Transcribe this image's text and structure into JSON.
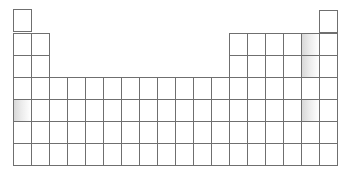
{
  "diagram": {
    "title": "",
    "type": "periodic-table-grid",
    "colors": {
      "line": "#6f6f6f",
      "background": "#ffffff",
      "shade_start": "#d8d8d8",
      "shade_end": "#ffffff"
    },
    "layout": {
      "origin_x": 13,
      "cell_w": 18,
      "cell_h": 22,
      "row1_top": 9,
      "row1_top_right": 10,
      "row_tops": [
        9,
        33,
        55,
        77,
        99,
        121,
        143
      ]
    },
    "rows": [
      {
        "row": 1,
        "columns": [
          1,
          18
        ]
      },
      {
        "row": 2,
        "columns": [
          1,
          2,
          13,
          14,
          15,
          16,
          17,
          18
        ]
      },
      {
        "row": 3,
        "columns": [
          1,
          2,
          13,
          14,
          15,
          16,
          17,
          18
        ]
      },
      {
        "row": 4,
        "columns": [
          1,
          2,
          3,
          4,
          5,
          6,
          7,
          8,
          9,
          10,
          11,
          12,
          13,
          14,
          15,
          16,
          17,
          18
        ]
      },
      {
        "row": 5,
        "columns": [
          1,
          2,
          3,
          4,
          5,
          6,
          7,
          8,
          9,
          10,
          11,
          12,
          13,
          14,
          15,
          16,
          17,
          18
        ]
      },
      {
        "row": 6,
        "columns": [
          1,
          2,
          3,
          4,
          5,
          6,
          7,
          8,
          9,
          10,
          11,
          12,
          13,
          14,
          15,
          16,
          17,
          18
        ]
      },
      {
        "row": 7,
        "columns": [
          1,
          2,
          3,
          4,
          5,
          6,
          7,
          8,
          9,
          10,
          11,
          12,
          13,
          14,
          15,
          16,
          17,
          18
        ]
      }
    ],
    "shaded_cells": [
      {
        "row": 2,
        "col": 17
      },
      {
        "row": 3,
        "col": 17
      },
      {
        "row": 5,
        "col": 1
      },
      {
        "row": 5,
        "col": 17
      }
    ]
  }
}
